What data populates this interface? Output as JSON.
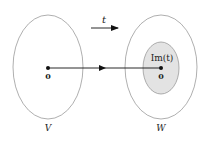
{
  "diagram": {
    "domain_label": "V",
    "codomain_label": "W",
    "map_label": "t",
    "image_label": "Im(t)",
    "zero_left": "0",
    "zero_right": "0",
    "colors": {
      "ellipse_stroke": "#9a9a9a",
      "image_fill": "#e3e3e3",
      "arrow": "#111111"
    }
  }
}
